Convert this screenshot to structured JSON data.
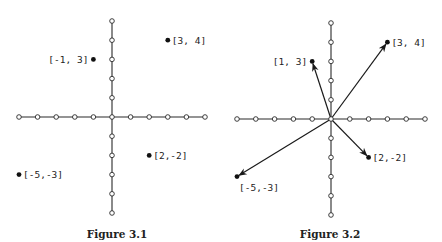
{
  "figures": [
    {
      "id": "fig-3-1",
      "caption": "Figure 3.1",
      "caption_pos": [
        117,
        238
      ],
      "origin": [
        112,
        117
      ],
      "unit": [
        18.6,
        19.2
      ],
      "axis_range": {
        "x": [
          -5,
          5
        ],
        "y": [
          -5,
          5
        ]
      },
      "show_vectors": false,
      "points": [
        {
          "coord": [
            3,
            4
          ],
          "label": "[3, 4]",
          "label_side": "right"
        },
        {
          "coord": [
            -1,
            3
          ],
          "label": "[-1, 3]",
          "label_side": "left"
        },
        {
          "coord": [
            2,
            -2
          ],
          "label": "[2,-2]",
          "label_side": "right"
        },
        {
          "coord": [
            -5,
            -3
          ],
          "label": "[-5,-3]",
          "label_side": "right"
        }
      ]
    },
    {
      "id": "fig-3-2",
      "caption": "Figure 3.2",
      "caption_pos": [
        330,
        238
      ],
      "origin": [
        331,
        119
      ],
      "unit": [
        18.8,
        19.2
      ],
      "axis_range": {
        "x": [
          -5,
          5
        ],
        "y": [
          -5,
          5
        ]
      },
      "show_vectors": true,
      "points": [
        {
          "coord": [
            3,
            4
          ],
          "label": "[3, 4]",
          "label_side": "right"
        },
        {
          "coord": [
            -1,
            3
          ],
          "label": "[1, 3]",
          "label_side": "left"
        },
        {
          "coord": [
            2,
            -2
          ],
          "label": "[2,-2]",
          "label_side": "right"
        },
        {
          "coord": [
            -5,
            -3
          ],
          "label": "[-5,-3]",
          "label_side": "below"
        }
      ]
    }
  ],
  "colors": {
    "ink": "#1a1a1a",
    "background": "#ffffff"
  }
}
